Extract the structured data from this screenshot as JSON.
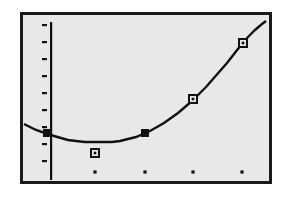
{
  "device": {
    "kind": "graphing-calculator-screen",
    "screen_background": "#e8e8e8",
    "ink_color": "#111111",
    "frame_color": "#1a1a1a"
  },
  "chart_data": {
    "type": "scatter",
    "title": "",
    "subtitle": "",
    "xlabel": "",
    "ylabel": "",
    "grid": false,
    "legend": false,
    "legend_position": "none",
    "axes": {
      "x_axis_visible": false,
      "y_axis_visible": true,
      "x_tick_marks_as_dots": true,
      "y_tick_count": 9,
      "x_tick_count": 4,
      "xlim": [
        -1,
        9
      ],
      "ylim": [
        -1,
        9
      ]
    },
    "series": [
      {
        "name": "regression-curve",
        "kind": "line",
        "style": "quadratic-fit",
        "description": "upward-opening parabola rising steeply to the right",
        "points_px": [
          [
            24,
            124
          ],
          [
            30,
            127
          ],
          [
            36,
            130
          ],
          [
            42,
            132
          ],
          [
            47,
            133
          ],
          [
            54,
            136
          ],
          [
            61,
            138
          ],
          [
            68,
            140
          ],
          [
            76,
            141
          ],
          [
            85,
            142
          ],
          [
            94,
            142
          ],
          [
            103,
            142
          ],
          [
            112,
            142
          ],
          [
            120,
            141
          ],
          [
            128,
            139
          ],
          [
            136,
            137
          ],
          [
            143,
            134
          ],
          [
            150,
            131
          ],
          [
            157,
            127
          ],
          [
            164,
            123
          ],
          [
            171,
            118
          ],
          [
            178,
            113
          ],
          [
            185,
            107
          ],
          [
            192,
            101
          ],
          [
            199,
            94
          ],
          [
            206,
            87
          ],
          [
            213,
            79
          ],
          [
            220,
            71
          ],
          [
            227,
            63
          ],
          [
            234,
            54
          ],
          [
            241,
            45
          ],
          [
            248,
            37
          ],
          [
            255,
            30
          ],
          [
            262,
            24
          ],
          [
            266,
            21
          ]
        ]
      },
      {
        "name": "data-points-filled",
        "kind": "scatter",
        "marker": "filled-square",
        "points_px": [
          [
            47,
            133
          ],
          [
            145,
            133
          ]
        ]
      },
      {
        "name": "data-points-open",
        "kind": "scatter",
        "marker": "open-square",
        "points_px": [
          [
            95,
            153
          ],
          [
            193,
            99
          ],
          [
            243,
            43
          ]
        ]
      }
    ],
    "y_axis_px": {
      "x": 47,
      "top": 19,
      "bottom": 177,
      "tick_y_positions": [
        24,
        41,
        58,
        75,
        92,
        109,
        126,
        143,
        160
      ],
      "tick_length": 5
    },
    "x_tick_dots_px": [
      [
        95,
        172
      ],
      [
        145,
        172
      ],
      [
        193,
        172
      ],
      [
        242,
        172
      ]
    ]
  }
}
